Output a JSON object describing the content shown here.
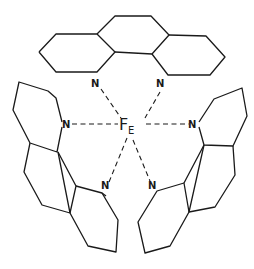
{
  "diagram": {
    "type": "chemical-structure",
    "metal_center": {
      "symbol_main": "F",
      "symbol_sub": "E"
    },
    "ligands": [
      {
        "name": "phenanthroline-top",
        "donor_atoms": [
          "N",
          "N"
        ]
      },
      {
        "name": "phenanthroline-left",
        "donor_atoms": [
          "N",
          "N"
        ]
      },
      {
        "name": "phenanthroline-right",
        "donor_atoms": [
          "N",
          "N"
        ]
      }
    ],
    "labels": {
      "n_top_left": "N",
      "n_top_right": "N",
      "n_left_upper": "N",
      "n_right_upper": "N",
      "n_left_lower": "N",
      "n_right_lower": "N"
    },
    "colors": {
      "ink": "#1a1a1a",
      "background": "#ffffff"
    }
  }
}
